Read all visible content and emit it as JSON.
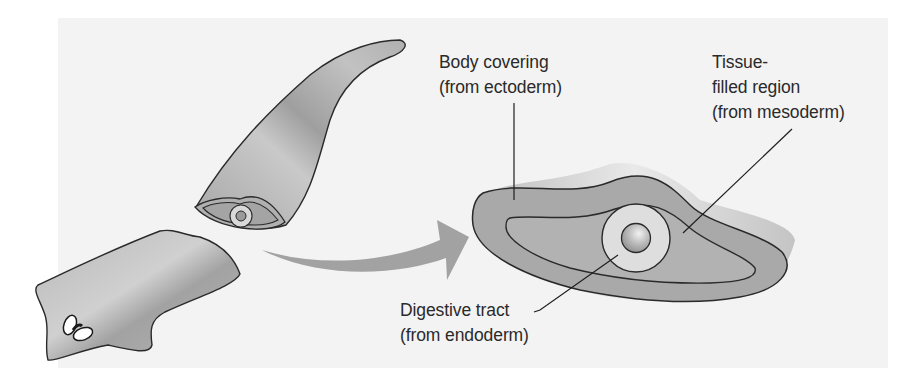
{
  "figure": {
    "background_color": "#f3f3f3",
    "body_fill": "#a9a9a9",
    "inner_fill": "#b2b2b2",
    "gut_fill": "#e0e0e0",
    "outline_color": "#2a2a2a",
    "arrow_color": "#9d9d9d"
  },
  "labels": {
    "body_covering": {
      "line1": "Body covering",
      "line2": "(from ectoderm)"
    },
    "tissue_region": {
      "line1": "Tissue-",
      "line2": "filled region",
      "line3": "(from mesoderm)"
    },
    "digestive_tract": {
      "line1": "Digestive tract",
      "line2": "(from endoderm)"
    }
  },
  "parts": [
    "flatworm-head-segment",
    "flatworm-tail-segment",
    "cut-surface",
    "transition-arrow",
    "enlarged-cross-section"
  ]
}
